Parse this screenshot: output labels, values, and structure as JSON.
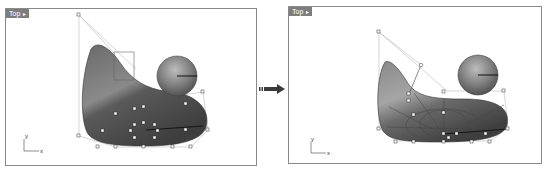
{
  "viewports": [
    {
      "id": "before",
      "tab_label": "Top",
      "tab_caret": "▸",
      "axis": {
        "x_label": "x",
        "y_label": "y"
      }
    },
    {
      "id": "after",
      "tab_label": "Top",
      "tab_caret": "▸",
      "axis": {
        "x_label": "x",
        "y_label": "y"
      }
    }
  ],
  "transition_arrow": {
    "icon": "right-arrow-icon"
  },
  "colors": {
    "viewport_border": "#8a8a8a",
    "tab_bg": "#7d7d7d",
    "tab_text": "#ffffff",
    "surface_dark": "#4a4a4a",
    "surface_light": "#b5b5b5",
    "control_line": "#b0b0b0",
    "arrow": "#3a3a3a"
  }
}
